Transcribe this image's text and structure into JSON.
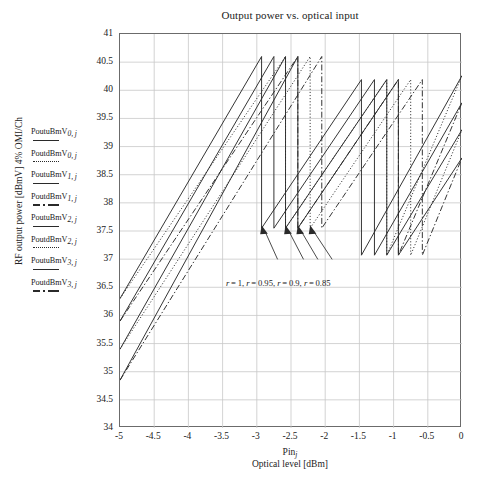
{
  "chart_data": {
    "type": "line",
    "title": "Output power vs. optical input",
    "xlabel": "Optical level [dBm]",
    "xlabel_var": "Pin",
    "xlabel_var_sub": "j",
    "ylabel": "RF output power [dBmV] 4% OMI/Ch",
    "xlim": [
      -5,
      0
    ],
    "ylim": [
      34,
      41
    ],
    "xticks": [
      "-5",
      "-4.5",
      "-4",
      "-3.5",
      "-3",
      "-2.5",
      "-2",
      "-1.5",
      "-1",
      "-0.5",
      "0"
    ],
    "xtick_values": [
      -5,
      -4.5,
      -4,
      -3.5,
      -3,
      -2.5,
      -2,
      -1.5,
      -1,
      -0.5,
      0
    ],
    "yticks": [
      "34",
      "34.5",
      "35",
      "35.5",
      "36",
      "36.5",
      "37",
      "37.5",
      "38",
      "38.5",
      "39",
      "39.5",
      "40",
      "40.5",
      "41"
    ],
    "ytick_values": [
      34,
      34.5,
      35,
      35.5,
      36,
      36.5,
      37,
      37.5,
      38,
      38.5,
      39,
      39.5,
      40,
      40.5,
      41
    ],
    "grid": true,
    "legend_position": "left-outside",
    "annotation": "r = 1, r = 0.95, r = 0.9, r = 0.85",
    "annotation_terms": [
      "r = 1",
      "r = 0.95",
      "r = 0.9",
      "r = 0.85"
    ],
    "arrow_count": 4,
    "series": [
      {
        "name": "PoutuBmV0,j",
        "style": "solid",
        "r": 1,
        "points": [
          [
            -5,
            36.3
          ],
          [
            -2.93,
            40.6
          ],
          [
            -2.93,
            37.55
          ],
          [
            -1.47,
            40.19
          ],
          [
            -1.47,
            37.07
          ],
          [
            0,
            40.26
          ]
        ]
      },
      {
        "name": "PoutdBmV0,j",
        "style": "dotted",
        "r": 1,
        "points": [
          [
            -5,
            36.3
          ],
          [
            -2.58,
            40.6
          ],
          [
            -2.58,
            37.55
          ],
          [
            -1.1,
            40.19
          ],
          [
            -1.1,
            37.07
          ],
          [
            0,
            40.26
          ]
        ]
      },
      {
        "name": "PoutuBmV1,j",
        "style": "solid",
        "r": 0.95,
        "points": [
          [
            -5,
            35.9
          ],
          [
            -2.75,
            40.6
          ],
          [
            -2.75,
            37.55
          ],
          [
            -1.28,
            40.19
          ],
          [
            -1.28,
            37.07
          ],
          [
            0,
            39.78
          ]
        ]
      },
      {
        "name": "PoutdBmV1,j",
        "style": "dashdot",
        "r": 0.95,
        "points": [
          [
            -5,
            35.9
          ],
          [
            -2.4,
            40.6
          ],
          [
            -2.4,
            37.55
          ],
          [
            -0.93,
            40.19
          ],
          [
            -0.93,
            37.07
          ],
          [
            0,
            39.78
          ]
        ]
      },
      {
        "name": "PoutuBmV2,j",
        "style": "solid",
        "r": 0.9,
        "points": [
          [
            -5,
            35.4
          ],
          [
            -2.58,
            40.6
          ],
          [
            -2.58,
            37.55
          ],
          [
            -1.1,
            40.19
          ],
          [
            -1.1,
            37.07
          ],
          [
            0,
            39.3
          ]
        ]
      },
      {
        "name": "PoutdBmV2,j",
        "style": "dotted",
        "r": 0.9,
        "points": [
          [
            -5,
            35.4
          ],
          [
            -2.22,
            40.6
          ],
          [
            -2.22,
            37.55
          ],
          [
            -0.75,
            40.19
          ],
          [
            -0.75,
            37.07
          ],
          [
            0,
            39.3
          ]
        ]
      },
      {
        "name": "PoutuBmV3,j",
        "style": "solid",
        "r": 0.85,
        "points": [
          [
            -5,
            34.85
          ],
          [
            -2.4,
            40.6
          ],
          [
            -2.4,
            37.55
          ],
          [
            -0.93,
            40.19
          ],
          [
            -0.93,
            37.07
          ],
          [
            0,
            38.8
          ]
        ]
      },
      {
        "name": "PoutdBmV3,j",
        "style": "dashdot",
        "r": 0.85,
        "points": [
          [
            -5,
            34.85
          ],
          [
            -2.05,
            40.6
          ],
          [
            -2.05,
            37.55
          ],
          [
            -0.58,
            40.19
          ],
          [
            -0.58,
            37.07
          ],
          [
            0,
            38.8
          ]
        ]
      }
    ]
  },
  "legend": {
    "items": [
      {
        "label": "PoutuBmV",
        "sub": "0, j",
        "style": "solid"
      },
      {
        "label": "PoutdBmV",
        "sub": "0, j",
        "style": "dotted"
      },
      {
        "label": "PoutuBmV",
        "sub": "1, j",
        "style": "solid"
      },
      {
        "label": "PoutdBmV",
        "sub": "1, j",
        "style": "dashdot"
      },
      {
        "label": "PoutuBmV",
        "sub": "2, j",
        "style": "solid"
      },
      {
        "label": "PoutdBmV",
        "sub": "2, j",
        "style": "dotted"
      },
      {
        "label": "PoutuBmV",
        "sub": "3, j",
        "style": "solid"
      },
      {
        "label": "PoutdBmV",
        "sub": "3, j",
        "style": "dashdot"
      }
    ]
  },
  "colors": {
    "line": "#2a2a2a",
    "grid": "#c8c8c8",
    "frame": "#6b6b6b",
    "text": "#222222",
    "background": "#ffffff"
  }
}
